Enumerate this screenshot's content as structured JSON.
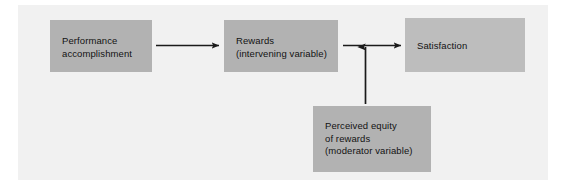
{
  "diagram": {
    "title_visible": false,
    "background_color": "#ffffff",
    "panel_color": "#f1f1f1",
    "node_color": "#b2b2b2",
    "node_color_light": "#bdbdbd",
    "connector_color": "#1a1a1a",
    "nodes": [
      {
        "id": "performance",
        "label": "Performance\naccomplishment",
        "role": "independent variable"
      },
      {
        "id": "rewards",
        "label": "Rewards\n(intervening variable)",
        "role": "intervening variable"
      },
      {
        "id": "satisfaction",
        "label": "Satisfaction",
        "role": "dependent variable"
      },
      {
        "id": "equity",
        "label": "Perceived equity\nof rewards\n(moderator variable)",
        "role": "moderator variable"
      }
    ],
    "connectors": [
      {
        "id": "performance-to-rewards",
        "from": "performance",
        "to": "rewards",
        "direction": "right",
        "style": "solid-arrow"
      },
      {
        "id": "rewards-to-satisfaction",
        "from": "rewards",
        "to": "satisfaction",
        "direction": "right",
        "style": "solid-arrow"
      },
      {
        "id": "equity-to-link",
        "from": "equity",
        "to": "rewards-to-satisfaction",
        "direction": "up",
        "style": "solid-arrow"
      }
    ]
  }
}
